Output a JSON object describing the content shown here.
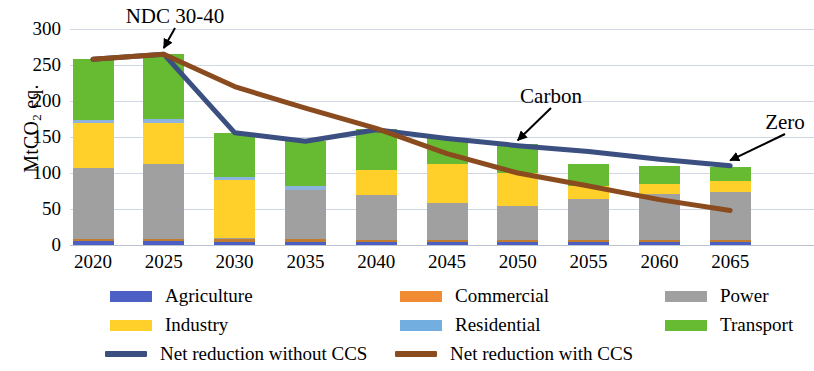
{
  "chart_data": {
    "type": "bar",
    "title": "",
    "xlabel": "",
    "ylabel": "MtCO2 eq.",
    "ylabel_parts": {
      "pre": "MtCO",
      "sub": "2",
      "post": " eq."
    },
    "categories": [
      "2020",
      "2025",
      "2030",
      "2035",
      "2040",
      "2045",
      "2050",
      "2055",
      "2060",
      "2065"
    ],
    "ylim": [
      0,
      300
    ],
    "yticks": [
      0,
      50,
      100,
      150,
      200,
      250,
      300
    ],
    "grid": true,
    "stacked": true,
    "legend_position": "bottom",
    "series": [
      {
        "name": "Agriculture",
        "color": "#4c5fc4",
        "values": [
          5,
          5,
          4,
          4,
          4,
          4,
          4,
          4,
          4,
          4
        ]
      },
      {
        "name": "Commercial",
        "color": "#c27c2e",
        "values": [
          4,
          4,
          4,
          4,
          3,
          3,
          3,
          3,
          3,
          3
        ]
      },
      {
        "name": "Power",
        "color": "#a0a0a0",
        "values": [
          98,
          103,
          1,
          69,
          62,
          52,
          47,
          57,
          64,
          66
        ]
      },
      {
        "name": "Industry",
        "color": "#ffcf2a",
        "values": [
          62,
          58,
          80,
          0,
          35,
          53,
          46,
          18,
          14,
          16
        ]
      },
      {
        "name": "Residential",
        "color": "#8cb4dd",
        "values": [
          5,
          5,
          5,
          5,
          0,
          0,
          0,
          0,
          0,
          0
        ]
      },
      {
        "name": "Transport",
        "color": "#66bb33",
        "values": [
          84,
          90,
          61,
          62,
          57,
          36,
          40,
          31,
          25,
          19
        ]
      }
    ],
    "lines": [
      {
        "name": "Net reduction without CCS",
        "color": "#3b4f80",
        "points": [
          {
            "x": "2020",
            "y": 258
          },
          {
            "x": "2025",
            "y": 265
          },
          {
            "x": "2030",
            "y": 156
          },
          {
            "x": "2035",
            "y": 144
          },
          {
            "x": "2040",
            "y": 160
          },
          {
            "x": "2045",
            "y": 148
          },
          {
            "x": "2050",
            "y": 138
          },
          {
            "x": "2055",
            "y": 130
          },
          {
            "x": "2060",
            "y": 119
          },
          {
            "x": "2065",
            "y": 110
          }
        ]
      },
      {
        "name": "Net reduction with CCS",
        "color": "#8a4b1e",
        "points": [
          {
            "x": "2020",
            "y": 258
          },
          {
            "x": "2025",
            "y": 265
          },
          {
            "x": "2030",
            "y": 220
          },
          {
            "x": "2035",
            "y": 190
          },
          {
            "x": "2040",
            "y": 162
          },
          {
            "x": "2045",
            "y": 127
          },
          {
            "x": "2050",
            "y": 100
          },
          {
            "x": "2055",
            "y": 82
          },
          {
            "x": "2060",
            "y": 63
          },
          {
            "x": "2065",
            "y": 48
          }
        ]
      }
    ],
    "annotations": [
      {
        "label": "NDC 30-40",
        "target_x": "2025",
        "target_y": 268
      },
      {
        "label": "Carbon",
        "target_x": "2050",
        "target_y": 140
      },
      {
        "label": "Zero",
        "target_x": "2065",
        "target_y": 112
      }
    ]
  },
  "legend": {
    "rows": [
      [
        {
          "name": "Agriculture",
          "color": "#4c5fc4",
          "kind": "swatch"
        },
        {
          "name": "Commercial",
          "color": "#f08a33",
          "kind": "swatch"
        },
        {
          "name": "Power",
          "color": "#a0a0a0",
          "kind": "swatch"
        }
      ],
      [
        {
          "name": "Industry",
          "color": "#ffcf2a",
          "kind": "swatch"
        },
        {
          "name": "Residential",
          "color": "#73aee0",
          "kind": "swatch"
        },
        {
          "name": "Transport",
          "color": "#66bb33",
          "kind": "swatch"
        }
      ],
      [
        {
          "name": "Net reduction without CCS",
          "color": "#3b4f80",
          "kind": "line"
        },
        {
          "name": "Net reduction with CCS",
          "color": "#8a4b1e",
          "kind": "line"
        }
      ]
    ]
  }
}
